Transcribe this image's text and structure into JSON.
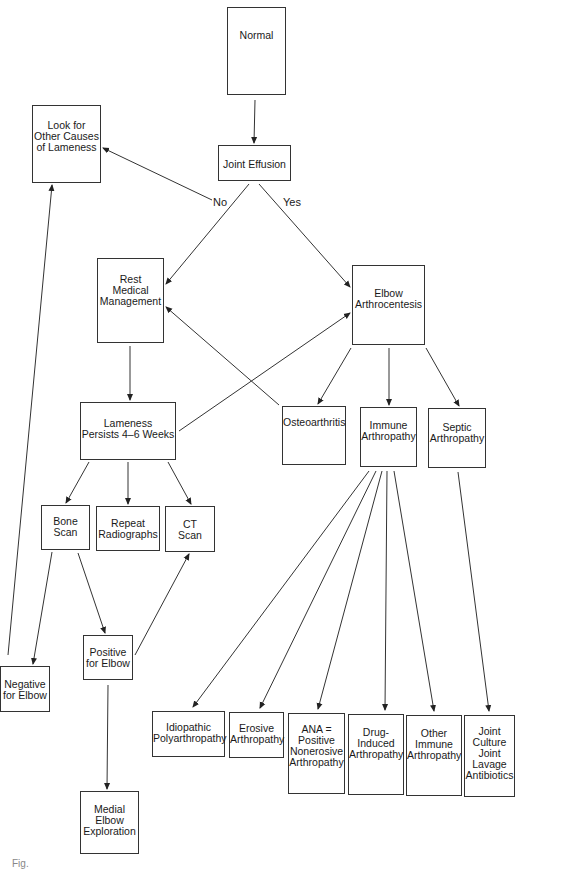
{
  "diagram": {
    "type": "flowchart",
    "nodes": [
      {
        "id": "normal",
        "label": "Normal",
        "x": 227,
        "y": 7,
        "w": 59,
        "h": 88,
        "pt": 22
      },
      {
        "id": "look_other",
        "label": "Look for\nOther Causes\nof Lameness",
        "x": 32,
        "y": 105,
        "w": 69,
        "h": 78,
        "pt": 14
      },
      {
        "id": "joint_effusion",
        "label": "Joint Effusion",
        "x": 218,
        "y": 145,
        "w": 73,
        "h": 36,
        "pt": 13
      },
      {
        "id": "rest",
        "label": "Rest\nMedical\nManagement",
        "x": 97,
        "y": 258,
        "w": 67,
        "h": 85,
        "pt": 15
      },
      {
        "id": "arthrocentesis",
        "label": "Elbow\nArthrocentesis",
        "x": 352,
        "y": 265,
        "w": 73,
        "h": 80,
        "pt": 22
      },
      {
        "id": "lameness_persists",
        "label": "Lameness\nPersists 4–6 Weeks",
        "x": 80,
        "y": 402,
        "w": 96,
        "h": 58,
        "pt": 15
      },
      {
        "id": "osteoarthritis",
        "label": "Osteoarthritis",
        "x": 282,
        "y": 406,
        "w": 64,
        "h": 59,
        "pt": 10
      },
      {
        "id": "immune",
        "label": "Immune\nArthropathy",
        "x": 360,
        "y": 407,
        "w": 57,
        "h": 60,
        "pt": 12
      },
      {
        "id": "septic",
        "label": "Septic\nArthropathy",
        "x": 428,
        "y": 408,
        "w": 58,
        "h": 60,
        "pt": 13
      },
      {
        "id": "bone_scan",
        "label": "Bone\nScan",
        "x": 41,
        "y": 505,
        "w": 49,
        "h": 45,
        "pt": 10
      },
      {
        "id": "repeat_rads",
        "label": "Repeat\nRadiographs",
        "x": 96,
        "y": 506,
        "w": 64,
        "h": 45,
        "pt": 11
      },
      {
        "id": "ct_scan",
        "label": "CT\nScan",
        "x": 165,
        "y": 506,
        "w": 50,
        "h": 46,
        "pt": 12
      },
      {
        "id": "positive",
        "label": "Positive\nfor Elbow",
        "x": 83,
        "y": 635,
        "w": 50,
        "h": 45,
        "pt": 11
      },
      {
        "id": "negative",
        "label": "Negative\nfor Elbow",
        "x": 0,
        "y": 666,
        "w": 50,
        "h": 46,
        "pt": 12
      },
      {
        "id": "medial",
        "label": "Medial\nElbow\nExploration",
        "x": 80,
        "y": 791,
        "w": 59,
        "h": 63,
        "pt": 12
      },
      {
        "id": "idiopathic",
        "label": "Idiopathic\nPolyarthropathy",
        "x": 152,
        "y": 711,
        "w": 73,
        "h": 46,
        "pt": 10
      },
      {
        "id": "erosive",
        "label": "Erosive\nArthropathy",
        "x": 229,
        "y": 712,
        "w": 55,
        "h": 46,
        "pt": 10
      },
      {
        "id": "ana",
        "label": "ANA =\nPositive\nNonerosive\nArthropathy",
        "x": 288,
        "y": 713,
        "w": 57,
        "h": 81,
        "pt": 10
      },
      {
        "id": "drug",
        "label": "Drug-\nInduced\nArthropathy",
        "x": 348,
        "y": 714,
        "w": 56,
        "h": 81,
        "pt": 12
      },
      {
        "id": "other_immune",
        "label": "Other\nImmune\nArthropathy",
        "x": 406,
        "y": 715,
        "w": 56,
        "h": 81,
        "pt": 12
      },
      {
        "id": "joint_culture",
        "label": "Joint\nCulture\nJoint\nLavage\nAntibiotics",
        "x": 464,
        "y": 715,
        "w": 51,
        "h": 82,
        "pt": 10
      }
    ],
    "edge_labels": [
      {
        "text": "No",
        "x": 213,
        "y": 196
      },
      {
        "text": "Yes",
        "x": 283,
        "y": 196
      }
    ],
    "edges": [
      {
        "from": "normal",
        "to": "joint_effusion",
        "x1": 255,
        "y1": 100,
        "x2": 254,
        "y2": 143
      },
      {
        "from": "joint_effusion",
        "to": "look_other",
        "label": "No",
        "x1": 212,
        "y1": 200,
        "x2": 103,
        "y2": 148
      },
      {
        "from": "joint_effusion",
        "to": "rest",
        "label": "No",
        "x1": 249,
        "y1": 184,
        "x2": 166,
        "y2": 284
      },
      {
        "from": "joint_effusion",
        "to": "arthrocentesis",
        "label": "Yes",
        "x1": 259,
        "y1": 184,
        "x2": 350,
        "y2": 287
      },
      {
        "from": "rest",
        "to": "lameness_persists",
        "x1": 130,
        "y1": 346,
        "x2": 130,
        "y2": 400
      },
      {
        "from": "osteoarthritis",
        "to": "rest",
        "x1": 279,
        "y1": 405,
        "x2": 166,
        "y2": 307
      },
      {
        "from": "lameness_persists",
        "to": "arthrocentesis",
        "x1": 179,
        "y1": 431,
        "x2": 350,
        "y2": 313
      },
      {
        "from": "arthrocentesis",
        "to": "osteoarthritis",
        "x1": 351,
        "y1": 348,
        "x2": 318,
        "y2": 404
      },
      {
        "from": "arthrocentesis",
        "to": "immune",
        "x1": 389,
        "y1": 348,
        "x2": 389,
        "y2": 405
      },
      {
        "from": "arthrocentesis",
        "to": "septic",
        "x1": 426,
        "y1": 348,
        "x2": 459,
        "y2": 406
      },
      {
        "from": "lameness_persists",
        "to": "bone_scan",
        "x1": 89,
        "y1": 462,
        "x2": 66,
        "y2": 503
      },
      {
        "from": "lameness_persists",
        "to": "repeat_rads",
        "x1": 128,
        "y1": 462,
        "x2": 128,
        "y2": 504
      },
      {
        "from": "lameness_persists",
        "to": "ct_scan",
        "x1": 168,
        "y1": 462,
        "x2": 191,
        "y2": 504
      },
      {
        "from": "bone_scan",
        "to": "negative",
        "x1": 52,
        "y1": 552,
        "x2": 33,
        "y2": 664
      },
      {
        "from": "bone_scan",
        "to": "positive",
        "x1": 78,
        "y1": 553,
        "x2": 105,
        "y2": 633
      },
      {
        "from": "positive",
        "to": "ct_scan",
        "x1": 135,
        "y1": 655,
        "x2": 189,
        "y2": 554
      },
      {
        "from": "negative",
        "to": "look_other",
        "x1": 8,
        "y1": 655,
        "x2": 52,
        "y2": 185
      },
      {
        "from": "positive",
        "to": "medial",
        "x1": 108,
        "y1": 685,
        "x2": 107,
        "y2": 789
      },
      {
        "from": "immune",
        "to": "idiopathic",
        "x1": 369,
        "y1": 471,
        "x2": 193,
        "y2": 707
      },
      {
        "from": "immune",
        "to": "erosive",
        "x1": 376,
        "y1": 471,
        "x2": 260,
        "y2": 708
      },
      {
        "from": "immune",
        "to": "ana",
        "x1": 382,
        "y1": 471,
        "x2": 318,
        "y2": 709
      },
      {
        "from": "immune",
        "to": "drug",
        "x1": 387,
        "y1": 471,
        "x2": 385,
        "y2": 710
      },
      {
        "from": "immune",
        "to": "other_immune",
        "x1": 394,
        "y1": 471,
        "x2": 434,
        "y2": 711
      },
      {
        "from": "septic",
        "to": "joint_culture",
        "x1": 458,
        "y1": 472,
        "x2": 489,
        "y2": 711
      }
    ],
    "caption": "Fig."
  }
}
